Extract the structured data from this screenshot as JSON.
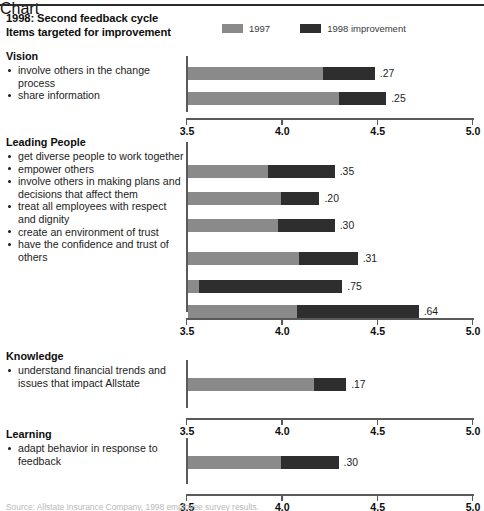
{
  "header": {
    "title_line1": "1998: Second feedback cycle",
    "title_line2": "Items targeted for improvement",
    "legend": [
      {
        "label": "1997",
        "color": "#8a8a8a",
        "name": "legend-swatch-1997"
      },
      {
        "label": "1998 improvement",
        "color": "#2e2e2e",
        "name": "legend-swatch-1998"
      }
    ]
  },
  "axis": {
    "ticks": [
      "3.5",
      "4.0",
      "4.5",
      "5.0"
    ],
    "min": 3.5,
    "max": 5.0
  },
  "sections": [
    {
      "heading": "Vision",
      "items": [
        {
          "text": "involve others in the change process",
          "value_label": ".27"
        },
        {
          "text": "share information",
          "value_label": ".25"
        }
      ]
    },
    {
      "heading": "Leading People",
      "items": [
        {
          "text": "get diverse people to work together",
          "value_label": ".35"
        },
        {
          "text": "empower others",
          "value_label": ".20"
        },
        {
          "text": "involve others in making plans and decisions that affect them",
          "value_label": ".30"
        },
        {
          "text": "treat all employees with respect and dignity",
          "value_label": ".31"
        },
        {
          "text": "create an environment of trust",
          "value_label": ".75"
        },
        {
          "text": "have the confidence and trust of others",
          "value_label": ".64"
        }
      ]
    },
    {
      "heading": "Knowledge",
      "items": [
        {
          "text": "understand financial trends and issues that impact Allstate",
          "value_label": ".17"
        }
      ]
    },
    {
      "heading": "Learning",
      "items": [
        {
          "text": "adapt behavior in response to feedback",
          "value_label": ".30"
        }
      ]
    }
  ],
  "footnote": "Source: Allstate Insurance Company, 1998 employee survey results.",
  "chart_data": {
    "type": "bar",
    "orientation": "horizontal",
    "stacked": true,
    "xlabel": "",
    "ylabel": "",
    "xlim": [
      3.5,
      5.0
    ],
    "xticks": [
      3.5,
      4.0,
      4.5,
      5.0
    ],
    "grid": false,
    "legend": [
      "1997",
      "1998 improvement"
    ],
    "legend_position": "top-right",
    "panels": [
      {
        "group": "Vision",
        "categories": [
          "involve others in the change process",
          "share information"
        ],
        "series": [
          {
            "name": "1997",
            "values": [
              4.22,
              4.3
            ]
          },
          {
            "name": "1998 improvement",
            "values": [
              0.27,
              0.25
            ]
          }
        ],
        "totals": [
          4.49,
          4.55
        ],
        "data_labels": [
          ".27",
          ".25"
        ]
      },
      {
        "group": "Leading People",
        "categories": [
          "get diverse people to work together",
          "empower others",
          "involve others in making plans and decisions that affect them",
          "treat all employees with respect and dignity",
          "create an environment of trust",
          "have the confidence and trust of others"
        ],
        "series": [
          {
            "name": "1997",
            "values": [
              3.93,
              4.0,
              3.98,
              4.09,
              3.57,
              4.08
            ]
          },
          {
            "name": "1998 improvement",
            "values": [
              0.35,
              0.2,
              0.3,
              0.31,
              0.75,
              0.64
            ]
          }
        ],
        "totals": [
          4.28,
          4.2,
          4.28,
          4.4,
          4.32,
          4.72
        ],
        "data_labels": [
          ".35",
          ".20",
          ".30",
          ".31",
          ".75",
          ".64"
        ]
      },
      {
        "group": "Knowledge",
        "categories": [
          "understand financial trends and issues that impact Allstate"
        ],
        "series": [
          {
            "name": "1997",
            "values": [
              4.17
            ]
          },
          {
            "name": "1998 improvement",
            "values": [
              0.17
            ]
          }
        ],
        "totals": [
          4.34
        ],
        "data_labels": [
          ".17"
        ]
      },
      {
        "group": "Learning",
        "categories": [
          "adapt behavior in response to feedback"
        ],
        "series": [
          {
            "name": "1997",
            "values": [
              4.0
            ]
          },
          {
            "name": "1998 improvement",
            "values": [
              0.3
            ]
          }
        ],
        "totals": [
          4.3
        ],
        "data_labels": [
          ".30"
        ]
      }
    ]
  },
  "layout": {
    "panels": [
      {
        "top": 50,
        "height": 82,
        "labels_top": 0,
        "plot_top": 6,
        "axis_height": 56,
        "axis_y": 62,
        "bars": [
          {
            "y": 11,
            "g": 4.22,
            "d": 4.49
          },
          {
            "y": 36,
            "g": 4.3,
            "d": 4.55
          }
        ]
      },
      {
        "top": 136,
        "height": 208,
        "labels_top": 0,
        "plot_top": 6,
        "axis_height": 170,
        "axis_y": 176,
        "bars": [
          {
            "y": 23,
            "g": 3.93,
            "d": 4.28
          },
          {
            "y": 50,
            "g": 4.0,
            "d": 4.2
          },
          {
            "y": 77,
            "g": 3.98,
            "d": 4.28
          },
          {
            "y": 110,
            "g": 4.09,
            "d": 4.4
          },
          {
            "y": 138,
            "g": 3.57,
            "d": 4.32
          },
          {
            "y": 163,
            "g": 4.08,
            "d": 4.72
          }
        ]
      },
      {
        "top": 350,
        "height": 78,
        "labels_top": 0,
        "plot_top": 10,
        "axis_height": 48,
        "axis_y": 58,
        "bars": [
          {
            "y": 18,
            "g": 4.17,
            "d": 4.34
          }
        ]
      },
      {
        "top": 428,
        "height": 76,
        "labels_top": 0,
        "plot_top": 10,
        "axis_height": 46,
        "axis_y": 56,
        "bars": [
          {
            "y": 18,
            "g": 4.0,
            "d": 4.3
          }
        ]
      }
    ]
  }
}
